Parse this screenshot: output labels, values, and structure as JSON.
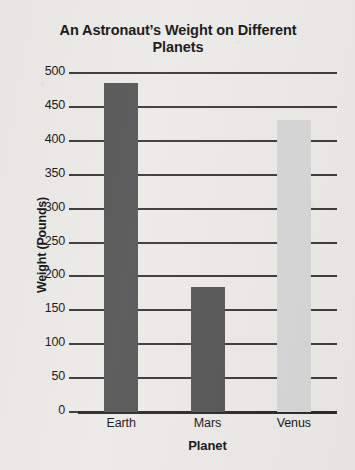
{
  "chart_data": {
    "type": "bar",
    "title": "An Astronaut’s Weight on Different Planets",
    "title_line1": "An Astronaut’s Weight on Different",
    "title_line2": "Planets",
    "xlabel": "Planet",
    "ylabel": "Weight (Pounds)",
    "categories": [
      "Earth",
      "Mars",
      "Venus"
    ],
    "values": [
      485,
      185,
      430
    ],
    "bar_colors": [
      "#565656",
      "#565656",
      "#d6d6d6"
    ],
    "ylim": [
      0,
      500
    ],
    "ytick_step": 50,
    "yticks": [
      0,
      50,
      100,
      150,
      200,
      250,
      300,
      350,
      400,
      450,
      500
    ],
    "ytick_labels": [
      "0",
      "50",
      "100",
      "150",
      "200",
      "250",
      "300",
      "350",
      "400",
      "450",
      "500"
    ],
    "grid": true,
    "grid_axis": "y",
    "legend": false,
    "legend_position": "none",
    "background_color": "#eceae7",
    "axis_color": "#3b3b3b",
    "text_color": "#161616"
  }
}
